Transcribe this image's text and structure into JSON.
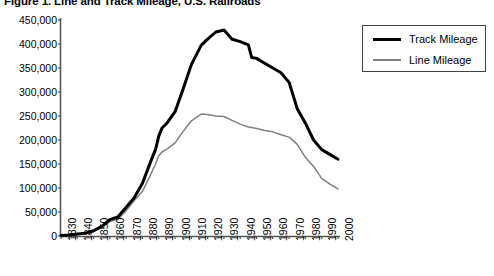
{
  "chart_data": {
    "type": "line",
    "title": "Figure 1. Line and Track Mileage, U.S. Railroads",
    "xlabel": "",
    "ylabel": "",
    "xlim": [
      1830,
      2000
    ],
    "ylim": [
      0,
      450000
    ],
    "grid": false,
    "legend_position": "upper right",
    "xticks": [
      1830,
      1840,
      1850,
      1860,
      1870,
      1880,
      1890,
      1900,
      1910,
      1920,
      1930,
      1940,
      1950,
      1960,
      1970,
      1980,
      1990,
      2000
    ],
    "xtick_labels": [
      "1830",
      "1840",
      "1850",
      "1860",
      "1870",
      "1880",
      "1890",
      "1900",
      "1910",
      "1920",
      "1930",
      "1940",
      "1950",
      "1960",
      "1970",
      "1980",
      "1990",
      "2000"
    ],
    "yticks": [
      0,
      50000,
      100000,
      150000,
      200000,
      250000,
      300000,
      350000,
      400000,
      450000
    ],
    "ytick_labels": [
      "0",
      "50,000",
      "100,000",
      "150,000",
      "200,000",
      "250,000",
      "300,000",
      "350,000",
      "400,000",
      "450,000"
    ],
    "x": [
      1830,
      1835,
      1840,
      1845,
      1850,
      1855,
      1860,
      1865,
      1870,
      1875,
      1880,
      1885,
      1888,
      1890,
      1892,
      1895,
      1900,
      1905,
      1910,
      1916,
      1920,
      1925,
      1930,
      1935,
      1940,
      1945,
      1947,
      1950,
      1955,
      1960,
      1965,
      1970,
      1975,
      1980,
      1985,
      1990,
      1995,
      2000
    ],
    "series": [
      {
        "name": "Track Mileage",
        "color": "#000000",
        "line_width": 3,
        "values": [
          1000,
          2000,
          4000,
          6000,
          11000,
          20000,
          34000,
          40000,
          60000,
          80000,
          110000,
          155000,
          180000,
          208000,
          225000,
          235000,
          259000,
          307000,
          357000,
          397000,
          410000,
          425000,
          429000,
          410000,
          405000,
          398000,
          372000,
          370000,
          360000,
          350000,
          340000,
          320000,
          265000,
          235000,
          200000,
          180000,
          170000,
          160000
        ]
      },
      {
        "name": "Line Mileage",
        "color": "#808080",
        "line_width": 1.5,
        "values": [
          500,
          1500,
          3000,
          4500,
          9000,
          18000,
          30000,
          35000,
          53000,
          74000,
          93000,
          128000,
          150000,
          167000,
          175000,
          181000,
          194000,
          218000,
          240000,
          254000,
          253000,
          250000,
          249000,
          241000,
          233000,
          227000,
          226000,
          224000,
          220000,
          217000,
          211000,
          206000,
          191000,
          164000,
          145000,
          120000,
          108000,
          98000
        ]
      }
    ]
  },
  "legend": {
    "items": [
      {
        "label": "Track Mileage"
      },
      {
        "label": "Line Mileage"
      }
    ]
  }
}
